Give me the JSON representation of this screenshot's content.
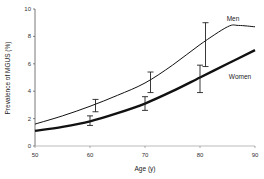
{
  "chart_data": {
    "type": "line",
    "title": "",
    "xlabel": "Age (y)",
    "ylabel": "Prevalence of MGUS (%)",
    "xlim": [
      50,
      90
    ],
    "ylim": [
      0,
      10
    ],
    "x_ticks": [
      "50",
      "60",
      "70",
      "80",
      "90"
    ],
    "y_ticks": [
      "0",
      "2",
      "4",
      "6",
      "8",
      "10"
    ],
    "grid": false,
    "legend": "inline labels at right",
    "series": [
      {
        "name": "Men",
        "line_style": "thin",
        "x": [
          50,
          55,
          60,
          65,
          70,
          75,
          80,
          85,
          87,
          90
        ],
        "values": [
          1.6,
          2.2,
          2.9,
          3.7,
          4.6,
          5.9,
          7.4,
          8.7,
          8.8,
          8.7
        ],
        "error_bars": [
          {
            "x": 61,
            "low": 2.5,
            "high": 3.4
          },
          {
            "x": 71,
            "low": 3.9,
            "high": 5.4
          },
          {
            "x": 81,
            "low": 5.8,
            "high": 9.0
          }
        ]
      },
      {
        "name": "Women",
        "line_style": "thick",
        "x": [
          50,
          55,
          60,
          65,
          70,
          75,
          80,
          85,
          90
        ],
        "values": [
          1.1,
          1.4,
          1.8,
          2.4,
          3.1,
          4.0,
          5.0,
          6.0,
          7.0
        ],
        "error_bars": [
          {
            "x": 60,
            "low": 1.5,
            "high": 2.2
          },
          {
            "x": 70,
            "low": 2.6,
            "high": 3.6
          },
          {
            "x": 80,
            "low": 3.9,
            "high": 5.9
          }
        ]
      }
    ]
  }
}
